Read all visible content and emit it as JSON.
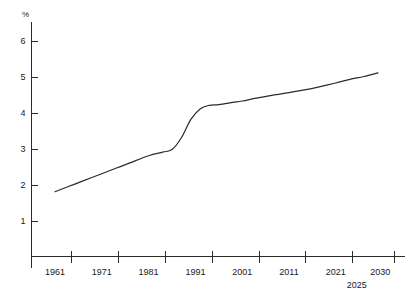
{
  "chart_data": {
    "type": "line",
    "title": "",
    "subtitle": "",
    "xlabel": "",
    "ylabel": "%",
    "grid": false,
    "legend": "none",
    "xlim": [
      1958,
      2033
    ],
    "ylim": [
      0,
      6.3
    ],
    "y_ticks": [
      1,
      2,
      3,
      4,
      5,
      6
    ],
    "y_tick_labels": [
      "1",
      "2",
      "3",
      "4",
      "5",
      "6"
    ],
    "x_tick_labels": [
      "1961",
      "1971",
      "1981",
      "1991",
      "2001",
      "2011",
      "2021",
      "2030"
    ],
    "x_secondary_label": "2025",
    "series": [
      {
        "name": "percent",
        "x": [
          1961,
          1964,
          1967,
          1971,
          1974,
          1977,
          1981,
          1984,
          1986,
          1988,
          1990,
          1992,
          1994,
          1996,
          1999,
          2001,
          2004,
          2007,
          2011,
          2014,
          2017,
          2021,
          2024,
          2027,
          2030
        ],
        "values": [
          1.8,
          1.95,
          2.1,
          2.3,
          2.45,
          2.6,
          2.8,
          2.9,
          2.97,
          3.3,
          3.8,
          4.1,
          4.2,
          4.22,
          4.28,
          4.32,
          4.4,
          4.47,
          4.55,
          4.62,
          4.7,
          4.82,
          4.92,
          5.0,
          5.1
        ]
      }
    ]
  },
  "axis_label": {
    "percent_symbol": "%"
  }
}
